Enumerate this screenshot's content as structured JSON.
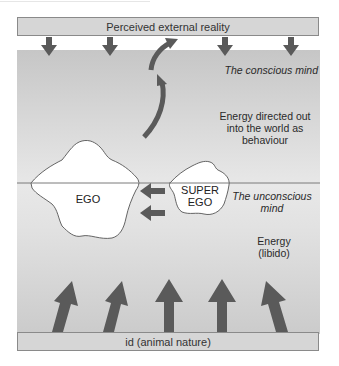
{
  "diagram": {
    "top_bar": {
      "label": "Perceived external reality"
    },
    "bottom_bar": {
      "label": "id (animal nature)"
    },
    "regions": {
      "conscious": {
        "label": "The conscious mind"
      },
      "unconscious": {
        "label": "The unconscious mind",
        "line1": "The unconscious",
        "line2": "mind"
      }
    },
    "annotations": {
      "behaviour": {
        "line1": "Energy directed out",
        "line2": "into the world as",
        "line3": "behaviour"
      },
      "libido": {
        "line1": "Energy",
        "line2": "(libido)"
      }
    },
    "blobs": {
      "ego": {
        "label": "EGO"
      },
      "superego": {
        "line1": "SUPER",
        "line2": "EGO"
      }
    },
    "colors": {
      "arrow": "#5a5a5a",
      "bar_fill": "#d6d6d6",
      "bar_border": "#8a8a8a",
      "horizon_line": "#7a7a7a",
      "blob_fill": "#ffffff"
    }
  }
}
